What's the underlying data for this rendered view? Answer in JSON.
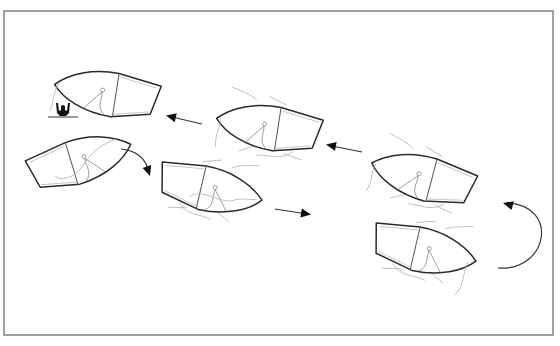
{
  "figure": {
    "frame": {
      "x": 4,
      "y": 11,
      "width": 549,
      "height": 324,
      "stroke": "#8a8a8a"
    },
    "swimmer": {
      "label": "person in water",
      "x": 63,
      "y": 113
    },
    "boats": [
      {
        "id": "boat-1",
        "step": 1,
        "heading": "right",
        "position": "bottom-right",
        "cx": 425,
        "cy": 250,
        "rotation": 8,
        "flip": false
      },
      {
        "id": "boat-2",
        "step": 2,
        "heading": "up-left",
        "position": "mid-right",
        "cx": 422,
        "cy": 177,
        "rotation": 20,
        "flip": true
      },
      {
        "id": "boat-3",
        "step": 3,
        "heading": "left",
        "position": "upper-middle",
        "cx": 268,
        "cy": 127,
        "rotation": 14,
        "flip": true
      },
      {
        "id": "boat-4",
        "step": 4,
        "heading": "left",
        "position": "top-left",
        "cx": 106,
        "cy": 93,
        "rotation": 14,
        "flip": true
      },
      {
        "id": "boat-5",
        "step": 5,
        "heading": "up-right",
        "position": "left",
        "cx": 81,
        "cy": 160,
        "rotation": -22,
        "flip": false
      },
      {
        "id": "boat-6",
        "step": 6,
        "heading": "right",
        "position": "center",
        "cx": 211,
        "cy": 189,
        "rotation": 8,
        "flip": false
      }
    ],
    "arrows": [
      {
        "id": "arrow-turn",
        "type": "curved",
        "path": "M 498 268 C 548 272, 560 205, 505 203",
        "head": {
          "x": 503,
          "y": 204,
          "angle": 190
        }
      },
      {
        "id": "arrow-to-boat-3",
        "type": "straight",
        "path": "M 362 152 L 330 145",
        "head": {
          "x": 327,
          "y": 144.5,
          "angle": 190
        }
      },
      {
        "id": "arrow-to-boat-4",
        "type": "straight",
        "path": "M 202 124 L 170 116",
        "head": {
          "x": 166,
          "y": 115,
          "angle": 195
        }
      },
      {
        "id": "arrow-down-to-boat-6",
        "type": "curved",
        "path": "M 121 149 C 135 150, 145 158, 149 171",
        "head": {
          "x": 150,
          "y": 175,
          "angle": 70
        }
      },
      {
        "id": "arrow-right-from-boat-6",
        "type": "straight",
        "path": "M 275 209 L 306 214",
        "head": {
          "x": 310,
          "y": 214.5,
          "angle": 9
        }
      }
    ],
    "colors": {
      "hull": "#2a2a2a",
      "water": "#b5b5b5",
      "arrow": "#111111",
      "background": "#ffffff"
    }
  }
}
